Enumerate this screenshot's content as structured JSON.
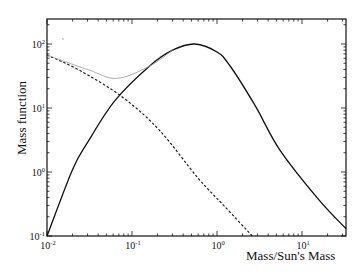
{
  "chart_data": {
    "type": "line",
    "title": "",
    "xlabel": "Mass/Sun's Mass",
    "ylabel": "Mass function",
    "xscale": "log",
    "yscale": "log",
    "xlim": [
      0.01,
      33
    ],
    "ylim": [
      0.1,
      250
    ],
    "grid": false,
    "legend": null,
    "x_ticks": [
      {
        "value": 0.01,
        "label": "10",
        "exp": "-2"
      },
      {
        "value": 0.1,
        "label": "10",
        "exp": "-1"
      },
      {
        "value": 1,
        "label": "10",
        "exp": "0"
      },
      {
        "value": 10,
        "label": "10",
        "exp": "1"
      }
    ],
    "y_ticks": [
      {
        "value": 0.1,
        "label": "10",
        "exp": "-1"
      },
      {
        "value": 1,
        "label": "10",
        "exp": "0"
      },
      {
        "value": 10,
        "label": "10",
        "exp": "1"
      },
      {
        "value": 100,
        "label": "10",
        "exp": "2"
      }
    ],
    "series": [
      {
        "name": "solid (log-normal component)",
        "style": "solid",
        "color": "#111111",
        "x": [
          0.01,
          0.02,
          0.03,
          0.063,
          0.16,
          0.3,
          0.55,
          1.0,
          1.4,
          2.8,
          5.5,
          16,
          33
        ],
        "y": [
          0.1,
          1.1,
          2.9,
          13,
          45,
          80,
          100,
          75,
          47,
          11,
          2.2,
          0.36,
          0.13
        ]
      },
      {
        "name": "dashed (power-law component)",
        "style": "dashed",
        "color": "#111111",
        "x": [
          0.01,
          0.024,
          0.076,
          0.21,
          0.6,
          1.2,
          2.6
        ],
        "y": [
          67,
          39,
          15,
          4.5,
          0.8,
          0.3,
          0.1
        ]
      },
      {
        "name": "dotted gray (sum)",
        "style": "thin-gray",
        "color": "#9a9a9a",
        "x": [
          0.01,
          0.03,
          0.066,
          0.16,
          0.3
        ],
        "y": [
          67,
          40,
          29,
          45,
          80
        ]
      }
    ]
  },
  "axes": {
    "xlabel": "Mass/Sun's Mass",
    "ylabel": "Mass function"
  }
}
